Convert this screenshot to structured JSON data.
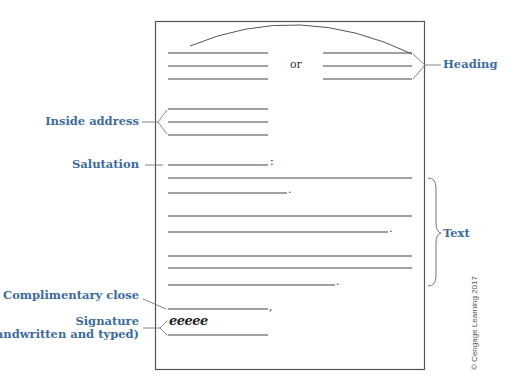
{
  "diagram": {
    "page": {
      "x": 155,
      "y": 21,
      "width": 269,
      "height": 348,
      "border_color": "#555555"
    },
    "separator_text": "or",
    "labels": {
      "heading": "Heading",
      "inside_address": "Inside address",
      "salutation": "Salutation",
      "text": "Text",
      "complimentary_close": "Complimentary close",
      "signature_line1": "Signature",
      "signature_line2": "(handwritten and typed)"
    },
    "signature_script": "eeeee",
    "punctuation": {
      "salutation": ":",
      "text_end": ".",
      "close": ","
    },
    "copyright": "© Cengage Learning 2017",
    "colors": {
      "label": "#3d6b9c",
      "line": "#444444",
      "leader": "#777777"
    }
  }
}
